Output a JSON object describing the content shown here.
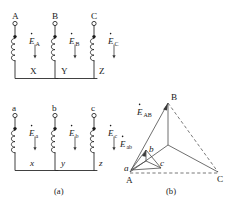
{
  "figure": {
    "caption_a": "(a)",
    "caption_b": "(b)"
  },
  "diagram_a": {
    "hv_windings": [
      {
        "top_terminal": "A",
        "bottom_terminal": "X",
        "emf_symbol": "E",
        "emf_subscript": "A"
      },
      {
        "top_terminal": "B",
        "bottom_terminal": "Y",
        "emf_symbol": "E",
        "emf_subscript": "B"
      },
      {
        "top_terminal": "C",
        "bottom_terminal": "Z",
        "emf_symbol": "E",
        "emf_subscript": "C"
      }
    ],
    "lv_windings": [
      {
        "top_terminal": "a",
        "bottom_terminal": "x",
        "emf_symbol": "E",
        "emf_subscript": "a"
      },
      {
        "top_terminal": "b",
        "bottom_terminal": "y",
        "emf_symbol": "E",
        "emf_subscript": "b"
      },
      {
        "top_terminal": "c",
        "bottom_terminal": "z",
        "emf_symbol": "E",
        "emf_subscript": "c"
      }
    ]
  },
  "diagram_b": {
    "outer_vertices": [
      {
        "label": "A"
      },
      {
        "label": "B"
      },
      {
        "label": "C"
      }
    ],
    "inner_vertices": [
      {
        "label": "a"
      },
      {
        "label": "b"
      },
      {
        "label": "c"
      }
    ],
    "phasor_labels": [
      {
        "symbol": "E",
        "subscript": "AB"
      },
      {
        "symbol": "E",
        "subscript": "ab"
      }
    ]
  },
  "colors": {
    "line": "#2b2b2b",
    "phasor": "#4a4a4a",
    "dashed": "#6a6a6a",
    "text": "#1a1a1a",
    "background": "#ffffff"
  }
}
